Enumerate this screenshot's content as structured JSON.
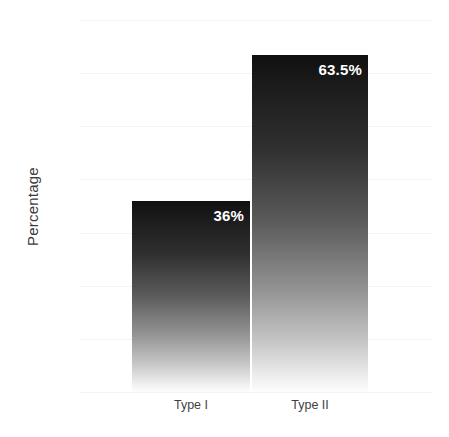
{
  "chart_data": {
    "type": "bar",
    "title": "",
    "subtitle": "",
    "xlabel": "",
    "ylabel": "Percentage",
    "categories": [
      "Type I",
      "Type II"
    ],
    "values": [
      36,
      63.5
    ],
    "data_labels": [
      "36%",
      "63.5%"
    ],
    "ylim": [
      0,
      70
    ],
    "yticks": [
      0,
      10,
      20,
      30,
      40,
      50,
      60,
      70
    ],
    "ytick_labels": [
      "0",
      "10",
      "20",
      "30",
      "40",
      "50",
      "60",
      "70"
    ],
    "grid": true,
    "grid_axis": "y",
    "legend": false,
    "legend_position": "none",
    "annotations": [],
    "series": [
      {
        "name": "Percentage",
        "values": [
          36,
          63.5
        ]
      }
    ],
    "bar_style": {
      "fill": "vertical-gradient",
      "gradient_top_color": "#101010",
      "gradient_bottom_color": "#fdfdfd",
      "data_label_color": "#ffffff",
      "data_label_align": "inside-top-right"
    },
    "colors": {
      "background": "#ffffff",
      "gridline": "#f4f4f4",
      "tick_text": "#4a4a4a",
      "axis_title": "#3b3b3b"
    }
  },
  "axes": {
    "y_title": "Percentage",
    "y_ticks": [
      {
        "label": "70",
        "value": 70
      },
      {
        "label": "60",
        "value": 60
      },
      {
        "label": "50",
        "value": 50
      },
      {
        "label": "40",
        "value": 40
      },
      {
        "label": "30",
        "value": 30
      },
      {
        "label": "20",
        "value": 20
      },
      {
        "label": "10",
        "value": 10
      },
      {
        "label": "0",
        "value": 0
      }
    ],
    "x_ticks": [
      {
        "label": "Type I"
      },
      {
        "label": "Type II"
      }
    ]
  },
  "bars": [
    {
      "category": "Type I",
      "value": 36,
      "label": "36%"
    },
    {
      "category": "Type II",
      "value": 63.5,
      "label": "63.5%"
    }
  ]
}
